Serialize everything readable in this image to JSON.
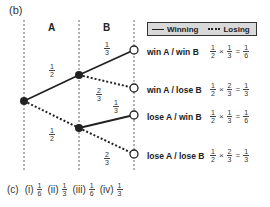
{
  "part_b_label": "(b)",
  "columns": {
    "a": "A",
    "b": "B"
  },
  "legend": {
    "winning": "Winning",
    "losing": "Losing"
  },
  "branches": {
    "a_win": {
      "num": "1",
      "den": "2"
    },
    "a_lose": {
      "num": "1",
      "den": "2"
    },
    "b_win_after_win": {
      "num": "1",
      "den": "3"
    },
    "b_lose_after_win": {
      "num": "2",
      "den": "3"
    },
    "b_win_after_lose": {
      "num": "1",
      "den": "3"
    },
    "b_lose_after_lose": {
      "num": "2",
      "den": "3"
    }
  },
  "outcomes": [
    {
      "label": "win A / win B",
      "f1n": "1",
      "f1d": "2",
      "op": "×",
      "f2n": "1",
      "f2d": "3",
      "eq": "=",
      "rn": "1",
      "rd": "6"
    },
    {
      "label": "win A / lose B",
      "f1n": "1",
      "f1d": "2",
      "op": "×",
      "f2n": "2",
      "f2d": "3",
      "eq": "=",
      "rn": "1",
      "rd": "3"
    },
    {
      "label": "lose A / win B",
      "f1n": "1",
      "f1d": "2",
      "op": "×",
      "f2n": "1",
      "f2d": "3",
      "eq": "=",
      "rn": "1",
      "rd": "6"
    },
    {
      "label": "lose A / lose B",
      "f1n": "1",
      "f1d": "2",
      "op": "×",
      "f2n": "2",
      "f2d": "3",
      "eq": "=",
      "rn": "1",
      "rd": "3"
    }
  ],
  "part_c": {
    "label": "(c)",
    "answers": [
      {
        "roman": "(i)",
        "num": "1",
        "den": "6"
      },
      {
        "roman": "(ii)",
        "num": "1",
        "den": "3"
      },
      {
        "roman": "(iii)",
        "num": "1",
        "den": "6"
      },
      {
        "roman": "(iv)",
        "num": "1",
        "den": "3"
      }
    ]
  },
  "colors": {
    "line": "#222222",
    "legend_bg": "#d9d9d9",
    "node_fill": "#222222",
    "end_node_fill": "#ffffff"
  }
}
